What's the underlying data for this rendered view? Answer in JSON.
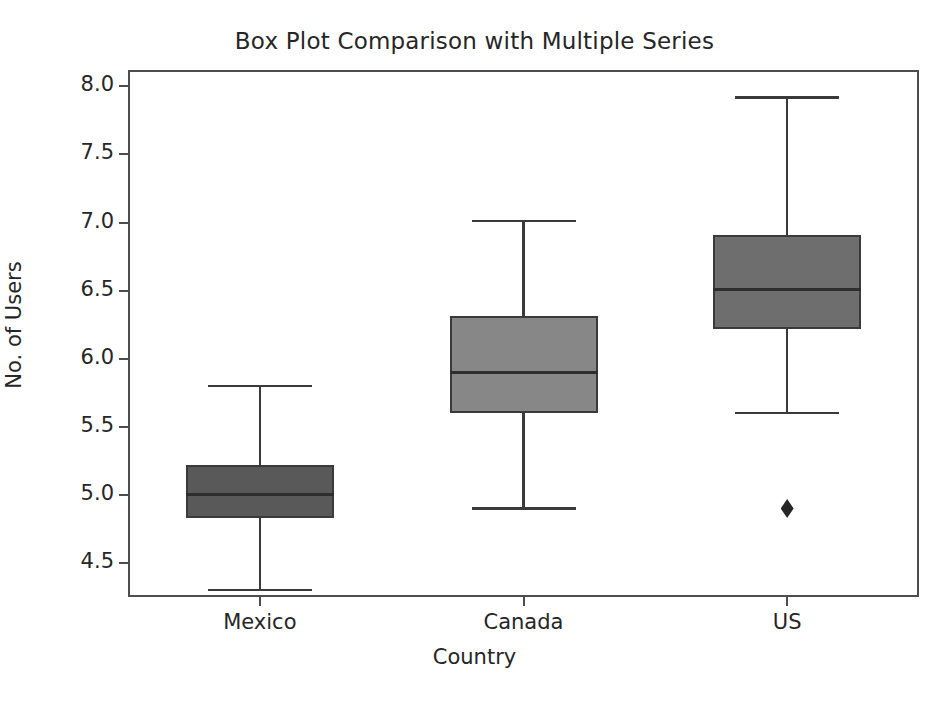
{
  "chart_data": {
    "type": "box",
    "title": "Box Plot Comparison with Multiple Series",
    "xlabel": "Country",
    "ylabel": "No. of Users",
    "categories": [
      "Mexico",
      "Canada",
      "US"
    ],
    "ylim": [
      4.25,
      8.12
    ],
    "yticks": [
      "8.0",
      "7.5",
      "7.0",
      "6.5",
      "6.0",
      "5.5",
      "5.0",
      "4.5"
    ],
    "ytick_values": [
      8.0,
      7.5,
      7.0,
      6.5,
      6.0,
      5.5,
      5.0,
      4.5
    ],
    "grid": false,
    "legend": "none",
    "boxes": [
      {
        "name": "Mexico",
        "whisker_low": 4.3,
        "q1": 4.83,
        "median": 5.0,
        "q3": 5.22,
        "whisker_high": 5.8,
        "fliers": [],
        "fill": "#595959",
        "edge": "#3a3a3a"
      },
      {
        "name": "Canada",
        "whisker_low": 4.9,
        "q1": 5.6,
        "median": 5.9,
        "q3": 6.31,
        "whisker_high": 7.01,
        "fliers": [],
        "fill": "#878787",
        "edge": "#3a3a3a"
      },
      {
        "name": "US",
        "whisker_low": 5.6,
        "q1": 6.22,
        "median": 6.51,
        "q3": 6.91,
        "whisker_high": 7.92,
        "fliers": [
          4.9
        ],
        "fill": "#6e6e6e",
        "edge": "#3a3a3a"
      }
    ],
    "colors": {
      "axis": "#4d4d4d",
      "text": "#262626",
      "background": "#ffffff"
    }
  }
}
